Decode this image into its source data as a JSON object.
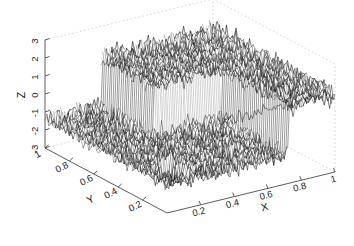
{
  "figure": {
    "kind": "matlab-3d-mesh-plot",
    "background_color": "#ffffff",
    "mesh_color": "#000000",
    "axis_color": "#4a4a4a",
    "box_color": "#c9c9c9"
  },
  "axes": {
    "x": {
      "label": "X",
      "ticks": [
        "0.2",
        "0.4",
        "0.6",
        "0.8",
        "1"
      ],
      "tick_values": [
        0.2,
        0.4,
        0.6,
        0.8,
        1.0
      ],
      "range": [
        0,
        1
      ],
      "direction": "ascending-left-to-right"
    },
    "y": {
      "label": "Y",
      "ticks": [
        "1",
        "0.8",
        "0.6",
        "0.4",
        "0.2"
      ],
      "tick_values": [
        1.0,
        0.8,
        0.6,
        0.4,
        0.2
      ],
      "range": [
        0,
        1
      ],
      "direction": "descending-left-to-right"
    },
    "z": {
      "label": "Z",
      "ticks": [
        "3",
        "2",
        "1",
        "0",
        "-1",
        "-2",
        "-3"
      ],
      "tick_values": [
        3,
        2,
        1,
        0,
        -1,
        -2,
        -3
      ],
      "range": [
        -3,
        3
      ],
      "direction": "ascending-bottom-to-top"
    }
  },
  "chart_data": {
    "type": "mesh3d-surface",
    "title": "",
    "xlabel": "X",
    "ylabel": "Y",
    "zlabel": "Z",
    "xlim": [
      0,
      1
    ],
    "ylim": [
      0,
      1
    ],
    "zlim": [
      -3,
      3
    ],
    "grid": false,
    "legend": null,
    "style": "wireframe-mesh",
    "surface_model": {
      "grid_nx": 96,
      "grid_ny": 64,
      "noise_amplitude": 0.55,
      "plateau_low_level": -1.35,
      "plateau_high_level": 1.35,
      "step_boundary_note": "high plateau occupies the region of larger X and larger Y; low plateau occupies smaller X / smaller Y",
      "step_edges": [
        {
          "from": [
            0.33,
            1.0
          ],
          "to": [
            0.33,
            0.55
          ]
        },
        {
          "from": [
            0.33,
            0.55
          ],
          "to": [
            0.72,
            0.55
          ]
        },
        {
          "from": [
            0.72,
            0.55
          ],
          "to": [
            0.72,
            0.0
          ]
        }
      ],
      "minor_notch": {
        "x_center": 0.2,
        "y_center": 0.22,
        "depth": 0.7
      }
    },
    "camera": {
      "azimuth_deg": -37.5,
      "elevation_deg": 30,
      "projection": "orthographic"
    },
    "vertices_screen": {
      "origin_back_left_bottom": [
        45,
        148
      ],
      "origin_back_left_top": [
        45,
        40
      ],
      "front_bottom": [
        167,
        213
      ],
      "right_bottom": [
        335,
        172
      ],
      "back_right_top_approx": [
        333,
        33
      ],
      "back_top_mid_approx": [
        210,
        26
      ]
    }
  }
}
